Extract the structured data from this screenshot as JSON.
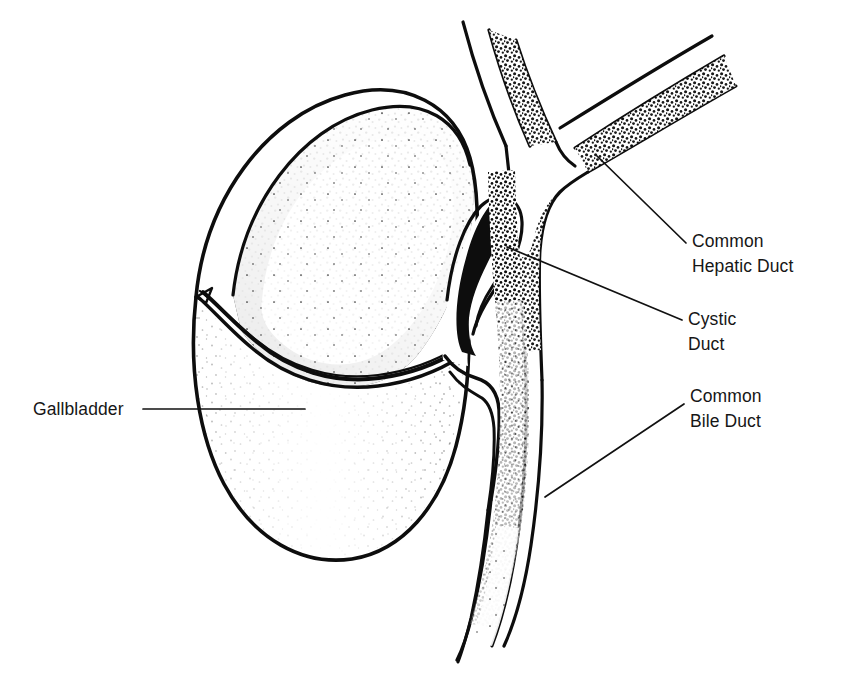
{
  "figure": {
    "style": "black-and-white line drawing with stipple shading, cut-away section",
    "background_color": "#ffffff",
    "ink_color": "#0d0d0d"
  },
  "labels": {
    "gallbladder": {
      "text": "Gallbladder",
      "lines": [
        "Gallbladder"
      ],
      "x": 33,
      "y": 415,
      "anchor": "start",
      "leader_from": [
        143,
        409
      ],
      "leader_to": [
        305,
        409
      ]
    },
    "common_hepatic_duct": {
      "text": "Common Hepatic Duct",
      "lines": [
        "Common",
        "Hepatic Duct"
      ],
      "x": 692,
      "y": 247,
      "anchor": "start",
      "leader_from": [
        686,
        243
      ],
      "leader_to": [
        597,
        156
      ]
    },
    "cystic_duct": {
      "text": "Cystic Duct",
      "lines": [
        "Cystic",
        "Duct"
      ],
      "x": 688,
      "y": 325,
      "anchor": "start",
      "leader_from": [
        682,
        320
      ],
      "leader_to": [
        507,
        247
      ]
    },
    "common_bile_duct": {
      "text": "Common Bile Duct",
      "lines": [
        "Common",
        "Bile Duct"
      ],
      "x": 690,
      "y": 402,
      "anchor": "start",
      "leader_from": [
        684,
        404
      ],
      "leader_to": [
        545,
        497
      ]
    }
  },
  "structures": [
    {
      "name": "gallbladder-body",
      "description": "pear-shaped organ, lower half intact wall, upper half cut away"
    },
    {
      "name": "gallbladder-mucosa",
      "description": "dark stippled inner lining of the opened fundus"
    },
    {
      "name": "cystic-duct",
      "description": "narrow hooked channel from gallbladder neck to common duct"
    },
    {
      "name": "common-hepatic-duct",
      "description": "vertical duct above the cystic junction"
    },
    {
      "name": "right-hepatic-branch",
      "description": "duct branch ascending to the upper right"
    },
    {
      "name": "left-hepatic-branch",
      "description": "duct branch ascending to the upper left"
    },
    {
      "name": "common-bile-duct",
      "description": "duct descending below the cystic junction"
    }
  ]
}
